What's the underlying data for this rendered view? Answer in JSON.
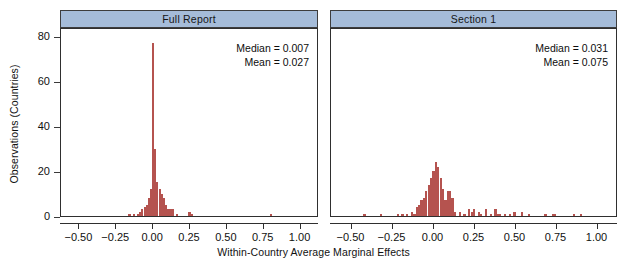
{
  "chart_data": {
    "type": "bar",
    "title": "",
    "xlabel": "Within-Country Average Marginal Effects",
    "ylabel": "Observations (Countries)",
    "xlim": [
      -0.625,
      1.125
    ],
    "ylim": [
      0,
      84
    ],
    "xticks": [
      -0.5,
      -0.25,
      0.0,
      0.25,
      0.5,
      0.75,
      1.0
    ],
    "xtick_labels": [
      "-0.50",
      "-0.25",
      "0.00",
      "0.25",
      "0.50",
      "0.75",
      "1.00"
    ],
    "yticks": [
      0,
      20,
      40,
      60,
      80
    ],
    "ytick_labels": [
      "0",
      "20",
      "40",
      "60",
      "80"
    ],
    "grid": false,
    "legend": "none",
    "bar_color": "#b5534f",
    "panel_strip_color": "#a5bcd9",
    "panels": [
      {
        "label": "Full Report",
        "annotations": [
          {
            "name": "median",
            "text": "Median =  0.007"
          },
          {
            "name": "mean",
            "text": "Mean =  0.027"
          }
        ],
        "stats": {
          "median": 0.007,
          "mean": 0.027
        },
        "bin_width": 0.0145,
        "bins": [
          {
            "x": -0.16,
            "y": 1
          },
          {
            "x": -0.131,
            "y": 1
          },
          {
            "x": -0.102,
            "y": 1
          },
          {
            "x": -0.087,
            "y": 2
          },
          {
            "x": -0.073,
            "y": 3
          },
          {
            "x": -0.058,
            "y": 4
          },
          {
            "x": -0.044,
            "y": 5
          },
          {
            "x": -0.029,
            "y": 8
          },
          {
            "x": -0.015,
            "y": 12
          },
          {
            "x": 0.0,
            "y": 77
          },
          {
            "x": 0.015,
            "y": 30
          },
          {
            "x": 0.029,
            "y": 15
          },
          {
            "x": 0.044,
            "y": 12
          },
          {
            "x": 0.058,
            "y": 10
          },
          {
            "x": 0.073,
            "y": 8
          },
          {
            "x": 0.087,
            "y": 5
          },
          {
            "x": 0.102,
            "y": 3
          },
          {
            "x": 0.116,
            "y": 3
          },
          {
            "x": 0.131,
            "y": 3
          },
          {
            "x": 0.16,
            "y": 1
          },
          {
            "x": 0.247,
            "y": 2
          },
          {
            "x": 0.262,
            "y": 1
          },
          {
            "x": 0.8,
            "y": 1
          }
        ]
      },
      {
        "label": "Section 1",
        "annotations": [
          {
            "name": "median",
            "text": "Median =  0.031"
          },
          {
            "name": "mean",
            "text": "Mean =  0.075"
          }
        ],
        "stats": {
          "median": 0.031,
          "mean": 0.075
        },
        "bin_width": 0.0145,
        "bins": [
          {
            "x": -0.42,
            "y": 1
          },
          {
            "x": -0.32,
            "y": 1
          },
          {
            "x": -0.218,
            "y": 1
          },
          {
            "x": -0.189,
            "y": 1
          },
          {
            "x": -0.16,
            "y": 1
          },
          {
            "x": -0.131,
            "y": 2
          },
          {
            "x": -0.116,
            "y": 1
          },
          {
            "x": -0.102,
            "y": 4
          },
          {
            "x": -0.087,
            "y": 5
          },
          {
            "x": -0.073,
            "y": 7
          },
          {
            "x": -0.058,
            "y": 8
          },
          {
            "x": -0.044,
            "y": 11
          },
          {
            "x": -0.029,
            "y": 14
          },
          {
            "x": -0.015,
            "y": 17
          },
          {
            "x": 0.0,
            "y": 20
          },
          {
            "x": 0.015,
            "y": 24
          },
          {
            "x": 0.029,
            "y": 22
          },
          {
            "x": 0.044,
            "y": 17
          },
          {
            "x": 0.058,
            "y": 12
          },
          {
            "x": 0.073,
            "y": 7
          },
          {
            "x": 0.087,
            "y": 11
          },
          {
            "x": 0.102,
            "y": 11
          },
          {
            "x": 0.116,
            "y": 8
          },
          {
            "x": 0.131,
            "y": 2
          },
          {
            "x": 0.16,
            "y": 2
          },
          {
            "x": 0.189,
            "y": 1
          },
          {
            "x": 0.218,
            "y": 3
          },
          {
            "x": 0.233,
            "y": 2
          },
          {
            "x": 0.247,
            "y": 3
          },
          {
            "x": 0.276,
            "y": 2
          },
          {
            "x": 0.291,
            "y": 1
          },
          {
            "x": 0.32,
            "y": 3
          },
          {
            "x": 0.349,
            "y": 1
          },
          {
            "x": 0.378,
            "y": 3
          },
          {
            "x": 0.392,
            "y": 1
          },
          {
            "x": 0.407,
            "y": 1
          },
          {
            "x": 0.436,
            "y": 1
          },
          {
            "x": 0.465,
            "y": 1
          },
          {
            "x": 0.494,
            "y": 2
          },
          {
            "x": 0.538,
            "y": 2
          },
          {
            "x": 0.581,
            "y": 1
          },
          {
            "x": 0.683,
            "y": 1
          },
          {
            "x": 0.727,
            "y": 1
          },
          {
            "x": 0.741,
            "y": 1
          },
          {
            "x": 0.858,
            "y": 1
          },
          {
            "x": 0.901,
            "y": 1
          }
        ]
      }
    ]
  },
  "axes": {
    "ylabel": "Observations (Countries)",
    "xlabel": "Within-Country Average Marginal Effects"
  }
}
